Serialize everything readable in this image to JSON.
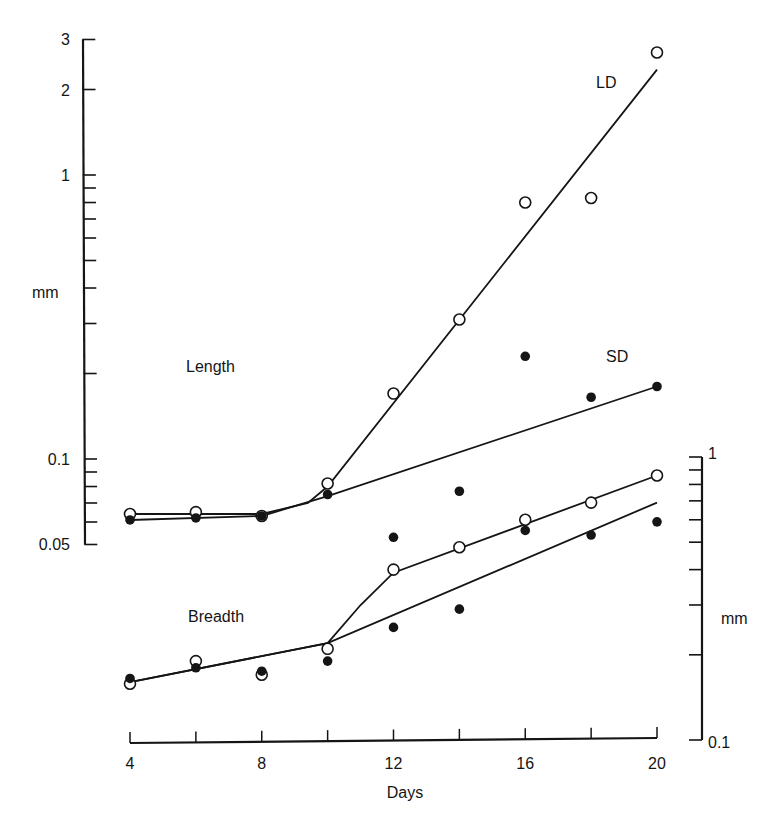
{
  "chart_data": {
    "type": "scatter",
    "title": "",
    "xlabel": "Days",
    "x_ticks": [
      4,
      6,
      8,
      10,
      12,
      14,
      16,
      18,
      20
    ],
    "x_tick_labels": [
      "4",
      "8",
      "12",
      "16",
      "20"
    ],
    "xlim": [
      4,
      20
    ],
    "left_axis": {
      "label": "mm",
      "scale": "log",
      "ylim": [
        0.05,
        3
      ],
      "tick_labels": [
        "3",
        "2",
        "1",
        "0.1",
        "0.05"
      ],
      "minor_ticks": [
        0.06,
        0.07,
        0.08,
        0.09,
        0.2,
        0.3,
        0.4,
        0.5,
        0.6,
        0.7,
        0.8,
        0.9,
        2,
        3
      ]
    },
    "right_axis": {
      "label": "mm",
      "scale": "log",
      "ylim": [
        0.1,
        1
      ],
      "tick_labels": [
        "1",
        "0.1"
      ],
      "minor_ticks": [
        0.2,
        0.3,
        0.4,
        0.5,
        0.6,
        0.7,
        0.8,
        0.9
      ]
    },
    "annotations": [
      {
        "text": "Length",
        "refers_to": "upper panel (left axis)"
      },
      {
        "text": "Breadth",
        "refers_to": "lower panel (right axis)"
      },
      {
        "text": "LD",
        "refers_to": "open circles series"
      },
      {
        "text": "SD",
        "refers_to": "filled circles series"
      }
    ],
    "legend": {
      "open_circle": "LD",
      "filled_circle": "SD"
    },
    "grid": false,
    "series": [
      {
        "name": "Length LD",
        "axis": "left",
        "marker": "open-circle",
        "x": [
          4,
          6,
          8,
          10,
          12,
          14,
          16,
          18,
          20
        ],
        "values": [
          0.064,
          0.065,
          0.063,
          0.082,
          0.17,
          0.31,
          0.8,
          0.83,
          2.7
        ],
        "fit": [
          [
            4,
            0.064
          ],
          [
            8,
            0.064
          ],
          [
            9.4,
            0.07
          ],
          [
            10,
            0.08
          ],
          [
            20,
            2.35
          ]
        ]
      },
      {
        "name": "Length SD",
        "axis": "left",
        "marker": "filled-circle",
        "x": [
          4,
          6,
          8,
          10,
          12,
          14,
          16,
          18,
          20
        ],
        "values": [
          0.061,
          0.062,
          0.063,
          0.075,
          0.053,
          0.077,
          0.23,
          0.165,
          0.18
        ],
        "fit": [
          [
            4,
            0.061
          ],
          [
            8,
            0.063
          ],
          [
            10,
            0.074
          ],
          [
            20,
            0.18
          ]
        ]
      },
      {
        "name": "Breadth LD",
        "axis": "right",
        "marker": "open-circle",
        "x": [
          4,
          6,
          8,
          10,
          12,
          14,
          16,
          18,
          20
        ],
        "values": [
          0.158,
          0.19,
          0.17,
          0.21,
          0.4,
          0.48,
          0.6,
          0.69,
          0.86
        ],
        "fit": [
          [
            4,
            0.16
          ],
          [
            10,
            0.22
          ],
          [
            11,
            0.3
          ],
          [
            12,
            0.39
          ],
          [
            20,
            0.86
          ]
        ]
      },
      {
        "name": "Breadth SD",
        "axis": "right",
        "marker": "filled-circle",
        "x": [
          4,
          6,
          8,
          10,
          12,
          14,
          16,
          18,
          20
        ],
        "values": [
          0.165,
          0.18,
          0.175,
          0.19,
          0.25,
          0.29,
          0.55,
          0.53,
          0.59
        ],
        "fit": [
          [
            4,
            0.16
          ],
          [
            10,
            0.22
          ],
          [
            20,
            0.69
          ]
        ]
      }
    ]
  }
}
